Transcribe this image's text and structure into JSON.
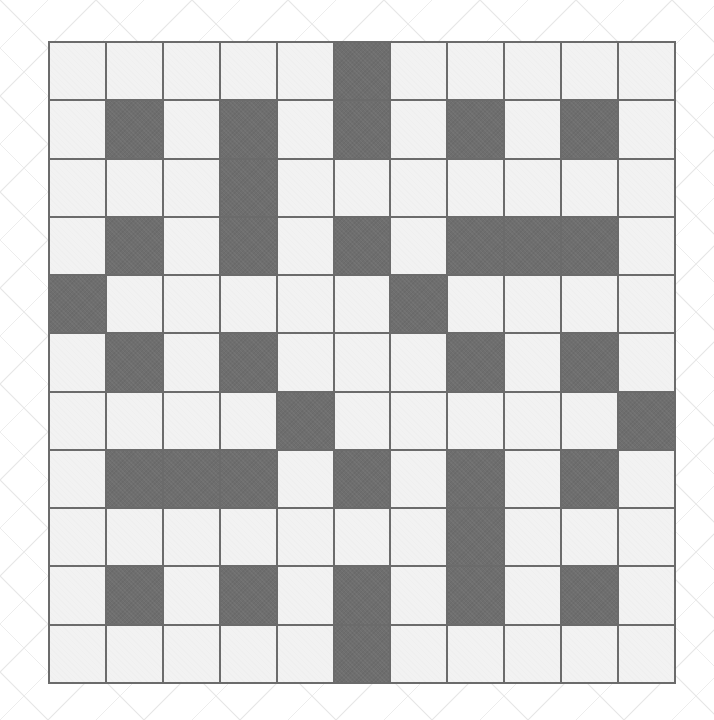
{
  "page": {
    "width": 714,
    "height": 720,
    "background_color": "#ffffff"
  },
  "watermark": {
    "name": "diagonal-crosshatch-watermark",
    "color": "#e8e8e8",
    "description": "faint repeating diagonal lattice lines across the page backdrop"
  },
  "grid": {
    "name": "crossword-grid",
    "rows": 11,
    "columns": 11,
    "cell_size_px": 57,
    "origin": {
      "x": 48,
      "y": 41
    },
    "size": {
      "width": 628,
      "height": 643
    },
    "colors": {
      "light_cell": "#f2f2f2",
      "dark_cell": "#6e6e6e",
      "grid_line": "#6b6b6b",
      "page_background": "#ffffff"
    },
    "legend": {
      "light": "open / fillable square",
      "dark": "blocked square"
    },
    "cell_states": [
      [
        "light",
        "light",
        "light",
        "light",
        "light",
        "dark",
        "light",
        "light",
        "light",
        "light",
        "light"
      ],
      [
        "light",
        "dark",
        "light",
        "dark",
        "light",
        "dark",
        "light",
        "dark",
        "light",
        "dark",
        "light"
      ],
      [
        "light",
        "light",
        "light",
        "dark",
        "light",
        "light",
        "light",
        "light",
        "light",
        "light",
        "light"
      ],
      [
        "light",
        "dark",
        "light",
        "dark",
        "light",
        "dark",
        "light",
        "dark",
        "dark",
        "dark",
        "light"
      ],
      [
        "dark",
        "light",
        "light",
        "light",
        "light",
        "light",
        "dark",
        "light",
        "light",
        "light",
        "light"
      ],
      [
        "light",
        "dark",
        "light",
        "dark",
        "light",
        "light",
        "light",
        "dark",
        "light",
        "dark",
        "light"
      ],
      [
        "light",
        "light",
        "light",
        "light",
        "dark",
        "light",
        "light",
        "light",
        "light",
        "light",
        "dark"
      ],
      [
        "light",
        "dark",
        "dark",
        "dark",
        "light",
        "dark",
        "light",
        "dark",
        "light",
        "dark",
        "light"
      ],
      [
        "light",
        "light",
        "light",
        "light",
        "light",
        "light",
        "light",
        "dark",
        "light",
        "light",
        "light"
      ],
      [
        "light",
        "dark",
        "light",
        "dark",
        "light",
        "dark",
        "light",
        "dark",
        "light",
        "dark",
        "light"
      ],
      [
        "light",
        "light",
        "light",
        "light",
        "light",
        "dark",
        "light",
        "light",
        "light",
        "light",
        "light"
      ]
    ],
    "dark_cell_counts_per_row": [
      1,
      5,
      1,
      6,
      2,
      4,
      2,
      6,
      1,
      5,
      1
    ],
    "total_dark_cells": 34,
    "total_cells": 121
  }
}
